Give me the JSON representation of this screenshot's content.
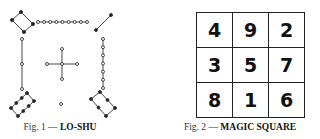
{
  "figures": [
    {
      "id": "lo-shu",
      "caption_prefix": "Fig. 1 —",
      "caption_title": "LO-SHU",
      "groups": [
        {
          "position": "top-left",
          "value": 4,
          "dot_type": "filled"
        },
        {
          "position": "top-center",
          "value": 9,
          "dot_type": "open"
        },
        {
          "position": "top-right",
          "value": 2,
          "dot_type": "filled"
        },
        {
          "position": "middle-left",
          "value": 3,
          "dot_type": "open"
        },
        {
          "position": "center",
          "value": 5,
          "dot_type": "open"
        },
        {
          "position": "middle-right",
          "value": 7,
          "dot_type": "open"
        },
        {
          "position": "bottom-left",
          "value": 8,
          "dot_type": "filled"
        },
        {
          "position": "bottom-center",
          "value": 1,
          "dot_type": "open"
        },
        {
          "position": "bottom-right",
          "value": 6,
          "dot_type": "filled"
        }
      ]
    },
    {
      "id": "magic-square",
      "caption_prefix": "Fig. 2 —",
      "caption_title": "MAGIC SQUARE",
      "rows": [
        [
          "4",
          "9",
          "2"
        ],
        [
          "3",
          "5",
          "7"
        ],
        [
          "8",
          "1",
          "6"
        ]
      ]
    }
  ],
  "colors": {
    "ink": "#222222",
    "background": "#ffffff"
  }
}
